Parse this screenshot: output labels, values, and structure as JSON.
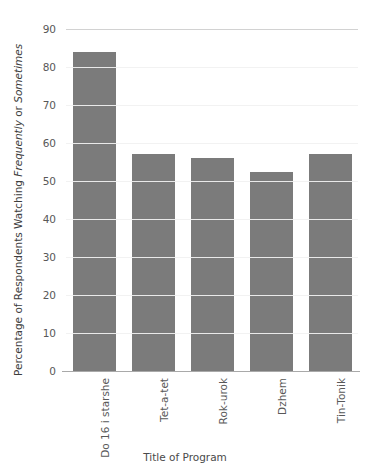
{
  "chart_data": {
    "type": "bar",
    "title": "",
    "clipped_title_remnant": "",
    "xlabel": "Title of Program",
    "ylabel_parts": [
      {
        "text": "Percentage of Respondents Watching ",
        "style": "normal"
      },
      {
        "text": "Frequently",
        "style": "italic"
      },
      {
        "text": " or ",
        "style": "normal"
      },
      {
        "text": "Sometimes",
        "style": "italic"
      }
    ],
    "ylabel": "Percentage of Respondents Watching Frequently or Sometimes",
    "categories": [
      "Do 16 i starshe",
      "Tet-a-tet",
      "Rok-urok",
      "Dzhem",
      "Tin-Tonik"
    ],
    "values": [
      84,
      57,
      56,
      52.5,
      57
    ],
    "ylim": [
      0,
      90
    ],
    "ytick_labels": [
      "90",
      "80",
      "70",
      "60",
      "50",
      "40",
      "30",
      "20",
      "10",
      "0"
    ],
    "ytick_values": [
      90,
      80,
      70,
      60,
      50,
      40,
      30,
      20,
      10,
      0
    ],
    "ystep": 10,
    "grid": "horizontal",
    "legend": "none",
    "bar_color": "#7b7b7b",
    "gridline_color": "#f2f2f2",
    "axis_color": "#a9a9a9",
    "top_gridline_color": "#d2d2d2",
    "background": "#ffffff"
  }
}
